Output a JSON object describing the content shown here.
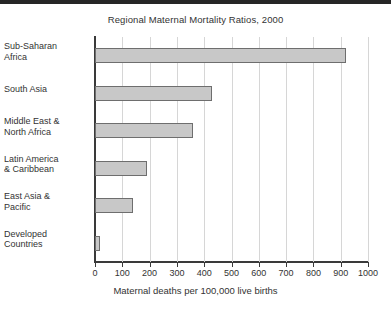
{
  "chart_data": {
    "type": "bar",
    "orientation": "horizontal",
    "title": "Regional Maternal Mortality Ratios, 2000",
    "xlabel": "Maternal deaths per 100,000 live births",
    "ylabel": "",
    "categories": [
      "Sub-Saharan Africa",
      "South Asia",
      "Middle East & North Africa",
      "Latin America & Caribbean",
      "East Asia & Pacific",
      "Developed Countries"
    ],
    "category_lines": [
      [
        "Sub-Saharan",
        "Africa"
      ],
      [
        "South Asia"
      ],
      [
        "Middle East &",
        "North Africa"
      ],
      [
        "Latin America",
        "& Caribbean"
      ],
      [
        "East Asia &",
        "Pacific"
      ],
      [
        "Developed",
        "Countries"
      ]
    ],
    "values": [
      920,
      430,
      360,
      190,
      140,
      20
    ],
    "xlim": [
      0,
      1000
    ],
    "xticks": [
      0,
      100,
      200,
      300,
      400,
      500,
      600,
      700,
      800,
      900,
      1000
    ],
    "xtick_labels": [
      "0",
      "100",
      "200",
      "300",
      "400",
      "500",
      "600",
      "700",
      "800",
      "900",
      "1000"
    ],
    "grid": "vertical",
    "legend": "none",
    "bar_fill_color": "#c8c8c8",
    "bar_border_color": "#6e6e6e",
    "gridline_color": "#d6d6d6",
    "axis_color": "#3a3a3a",
    "background_color": "#ffffff",
    "top_band_color": "#262626"
  }
}
